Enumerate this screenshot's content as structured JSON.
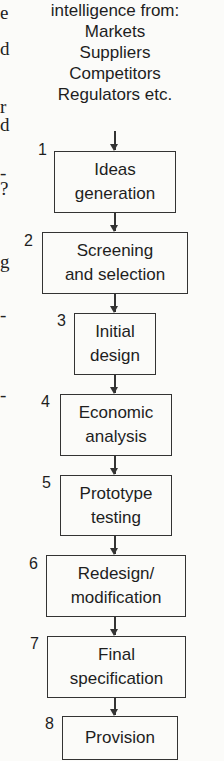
{
  "header": {
    "lines": [
      "intelligence from:",
      "Markets",
      "Suppliers",
      "Competitors",
      "Regulators etc."
    ]
  },
  "left_edge_fragments": [
    "e",
    "d",
    "r",
    "d",
    "-",
    "?",
    "g",
    "-",
    "-"
  ],
  "steps": [
    {
      "number": "1",
      "line1": "Ideas",
      "line2": "generation"
    },
    {
      "number": "2",
      "line1": "Screening",
      "line2": "and selection"
    },
    {
      "number": "3",
      "line1": "Initial",
      "line2": "design"
    },
    {
      "number": "4",
      "line1": "Economic",
      "line2": "analysis"
    },
    {
      "number": "5",
      "line1": "Prototype",
      "line2": "testing"
    },
    {
      "number": "6",
      "line1": "Redesign/",
      "line2": "modification"
    },
    {
      "number": "7",
      "line1": "Final",
      "line2": "specification"
    },
    {
      "number": "8",
      "line1": "Provision",
      "line2": ""
    }
  ]
}
